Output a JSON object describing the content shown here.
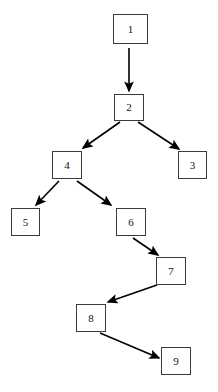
{
  "diagram": {
    "type": "directed-tree",
    "background_color": "#ffffff",
    "node_border_color": "#3b3b3b",
    "node_fill_color": "#ffffff",
    "edge_color": "#000000",
    "label_color": "#111111",
    "nodes": [
      {
        "id": "n1",
        "label": "1",
        "x": 113,
        "y": 14,
        "w": 35,
        "h": 30
      },
      {
        "id": "n2",
        "label": "2",
        "x": 114,
        "y": 94,
        "w": 30,
        "h": 27
      },
      {
        "id": "n3",
        "label": "3",
        "x": 178,
        "y": 151,
        "w": 29,
        "h": 28
      },
      {
        "id": "n4",
        "label": "4",
        "x": 52,
        "y": 151,
        "w": 30,
        "h": 28
      },
      {
        "id": "n5",
        "label": "5",
        "x": 11,
        "y": 208,
        "w": 29,
        "h": 28
      },
      {
        "id": "n6",
        "label": "6",
        "x": 116,
        "y": 208,
        "w": 30,
        "h": 28
      },
      {
        "id": "n7",
        "label": "7",
        "x": 156,
        "y": 257,
        "w": 30,
        "h": 28
      },
      {
        "id": "n8",
        "label": "8",
        "x": 76,
        "y": 304,
        "w": 30,
        "h": 28
      },
      {
        "id": "n9",
        "label": "9",
        "x": 161,
        "y": 347,
        "w": 30,
        "h": 28
      }
    ],
    "edges": [
      {
        "id": "e1",
        "from": "n1",
        "to": "n2",
        "x1": 129,
        "y1": 48,
        "x2": 129,
        "y2": 91
      },
      {
        "id": "e2",
        "from": "n2",
        "to": "n4",
        "x1": 120,
        "y1": 122,
        "x2": 83,
        "y2": 148
      },
      {
        "id": "e3",
        "from": "n2",
        "to": "n3",
        "x1": 138,
        "y1": 122,
        "x2": 179,
        "y2": 149
      },
      {
        "id": "e4",
        "from": "n4",
        "to": "n5",
        "x1": 59,
        "y1": 181,
        "x2": 36,
        "y2": 205
      },
      {
        "id": "e5",
        "from": "n4",
        "to": "n6",
        "x1": 77,
        "y1": 181,
        "x2": 111,
        "y2": 205
      },
      {
        "id": "e6",
        "from": "n6",
        "to": "n7",
        "x1": 133,
        "y1": 238,
        "x2": 158,
        "y2": 255
      },
      {
        "id": "e7",
        "from": "n7",
        "to": "n8",
        "x1": 157,
        "y1": 285,
        "x2": 108,
        "y2": 302
      },
      {
        "id": "e8",
        "from": "n8",
        "to": "n9",
        "x1": 100,
        "y1": 333,
        "x2": 159,
        "y2": 358
      }
    ]
  }
}
